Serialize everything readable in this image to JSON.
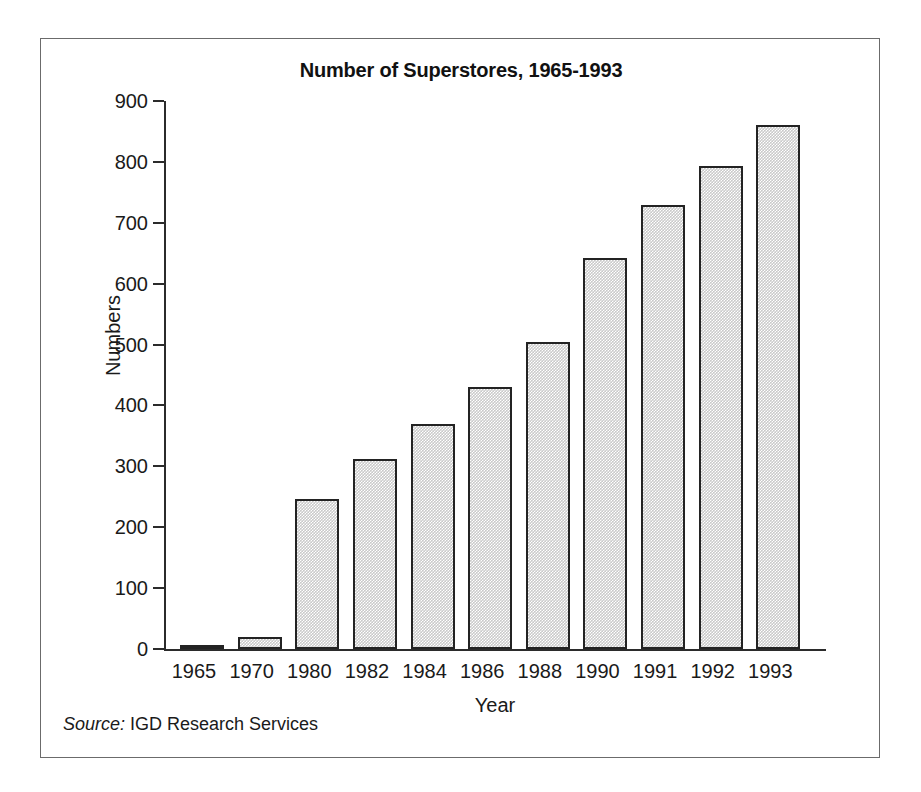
{
  "figure": {
    "title": "Number of Superstores, 1965-1993",
    "source_label": "Source:",
    "source_text": " IGD Research Services",
    "frame_color": "#6b6b6b",
    "bar_fill_color": "#c9c9c9",
    "bar_border_color": "#232323",
    "text_color": "#1a1a1a"
  },
  "chart_data": {
    "type": "bar",
    "title": "Number of Superstores, 1965-1993",
    "xlabel": "Year",
    "ylabel": "Numbers",
    "categories": [
      "1965",
      "1970",
      "1980",
      "1982",
      "1984",
      "1986",
      "1988",
      "1990",
      "1991",
      "1992",
      "1993"
    ],
    "values": [
      5,
      20,
      247,
      312,
      370,
      430,
      505,
      642,
      730,
      794,
      860
    ],
    "ylim": [
      0,
      900
    ],
    "ytick_labels": [
      "900",
      "800",
      "700",
      "600",
      "500",
      "400",
      "300",
      "200",
      "100",
      "0"
    ],
    "ytick_values": [
      900,
      800,
      700,
      600,
      500,
      400,
      300,
      200,
      100,
      0
    ],
    "ytick_step": 100,
    "grid": false,
    "legend": "none",
    "annotations": [
      "Source: IGD Research Services"
    ]
  }
}
